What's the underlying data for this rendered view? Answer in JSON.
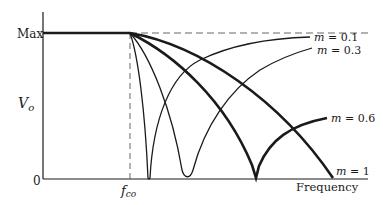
{
  "figure": {
    "type": "filter-response-diagram",
    "y_axis": {
      "label": "V",
      "label_subscript": "o",
      "tick_max": "Max",
      "tick_zero": "0"
    },
    "x_axis": {
      "label": "Frequency",
      "cutoff_label": "f",
      "cutoff_subscript": "co"
    },
    "curves": [
      {
        "name": "m-0.1",
        "label_var": "m",
        "label_eq": " = 0.1",
        "weight": "thin"
      },
      {
        "name": "m-0.3",
        "label_var": "m",
        "label_eq": " = 0.3",
        "weight": "thin"
      },
      {
        "name": "m-0.6",
        "label_var": "m",
        "label_eq": " = 0.6",
        "weight": "thick"
      },
      {
        "name": "m-1",
        "label_var": "m",
        "label_eq": " = 1",
        "weight": "thick"
      }
    ],
    "colors": {
      "ink": "#1a1a1a",
      "background": "#ffffff"
    }
  }
}
